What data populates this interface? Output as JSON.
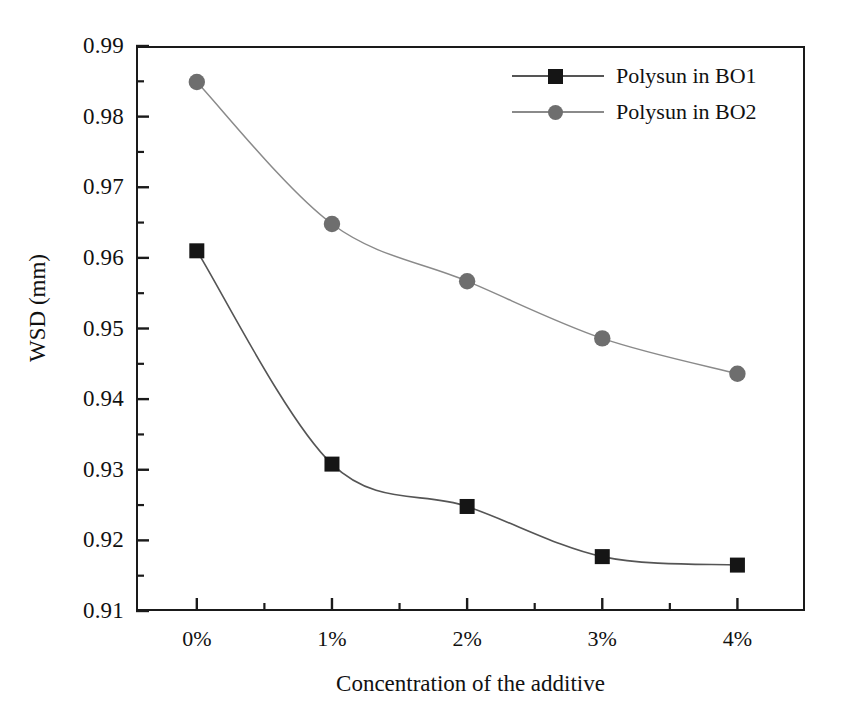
{
  "chart_data": {
    "type": "line",
    "title": "",
    "subtitle": "",
    "xlabel": "Concentration of the additive",
    "ylabel": "WSD (mm)",
    "categories": [
      "0%",
      "1%",
      "2%",
      "3%",
      "4%"
    ],
    "x": [
      0,
      1,
      2,
      3,
      4
    ],
    "xlim": [
      -0.45,
      4.5
    ],
    "ylim": [
      0.91,
      0.99
    ],
    "y_ticks": [
      0.91,
      0.92,
      0.93,
      0.94,
      0.95,
      0.96,
      0.97,
      0.98,
      0.99
    ],
    "y_tick_labels": [
      "0.91",
      "0.92",
      "0.93",
      "0.94",
      "0.95",
      "0.96",
      "0.97",
      "0.98",
      "0.99"
    ],
    "y_minor_ticks": [
      0.915,
      0.925,
      0.935,
      0.945,
      0.955,
      0.965,
      0.975,
      0.985
    ],
    "grid": false,
    "legend_position": "top-right",
    "series": [
      {
        "name": "Polysun in BO1",
        "marker": "square",
        "color": "#151515",
        "line_color": "#555555",
        "values": [
          0.961,
          0.9308,
          0.9248,
          0.9177,
          0.9165
        ]
      },
      {
        "name": "Polysun in BO2",
        "marker": "circle",
        "color": "#6e6e6e",
        "line_color": "#8a8a8a",
        "values": [
          0.9849,
          0.9648,
          0.9567,
          0.9486,
          0.9436
        ]
      }
    ]
  },
  "axes": {
    "x_title": "Concentration of the additive",
    "y_title": "WSD (mm)",
    "x_tick_labels": [
      "0%",
      "1%",
      "2%",
      "3%",
      "4%"
    ],
    "y_tick_labels": [
      "0.99",
      "0.98",
      "0.97",
      "0.96",
      "0.95",
      "0.94",
      "0.93",
      "0.92",
      "0.91"
    ]
  },
  "legend": {
    "entries": [
      {
        "label": "Polysun in BO1",
        "marker": "square-marker",
        "color": "#151515"
      },
      {
        "label": "Polysun in BO2",
        "marker": "circle-marker",
        "color": "#6e6e6e"
      }
    ]
  }
}
